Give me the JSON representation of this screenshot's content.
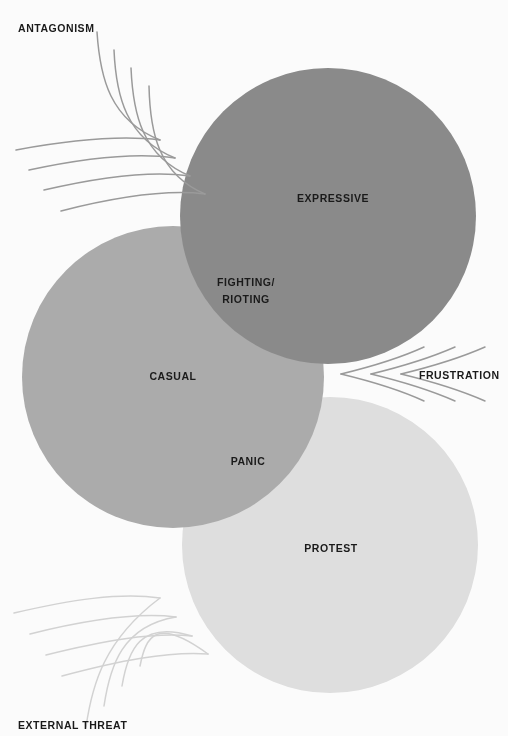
{
  "diagram": {
    "background_color": "#fbfbfb",
    "circles": [
      {
        "id": "expressive",
        "label": "EXPRESSIVE",
        "color": "#8c8c8c",
        "label_x": 333,
        "label_y": 199,
        "cx": 328,
        "cy": 216,
        "r": 148
      },
      {
        "id": "casual",
        "label": "CASUAL",
        "color": "#aeaeae",
        "label_x": 173,
        "label_y": 377,
        "cx": 173,
        "cy": 377,
        "r": 151
      },
      {
        "id": "protest",
        "label": "PROTEST",
        "color": "#e2e2e2",
        "label_x": 331,
        "label_y": 549,
        "cx": 330,
        "cy": 545,
        "r": 148
      }
    ],
    "intersections": [
      {
        "id": "fighting-rioting",
        "label_line_1": "FIGHTING/",
        "label_line_2": "RIOTING",
        "label_x": 246,
        "label_y": 283
      },
      {
        "id": "panic",
        "label": "PANIC",
        "label_x": 248,
        "label_y": 462
      }
    ],
    "drivers": [
      {
        "id": "antagonism",
        "label": "ANTAGONISM",
        "label_x": 18,
        "label_y": 32,
        "arrow_color": "#9a9a9a"
      },
      {
        "id": "frustration",
        "label": "FRUSTRATION",
        "label_x": 419,
        "label_y": 379,
        "arrow_color": "#9a9a9a"
      },
      {
        "id": "external-threat",
        "label": "EXTERNAL THREAT",
        "label_x": 18,
        "label_y": 729,
        "arrow_color": "#d2d2d2"
      }
    ]
  }
}
